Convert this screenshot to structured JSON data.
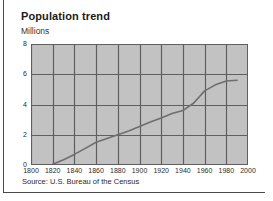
{
  "chart_data": {
    "type": "line",
    "title": "Population trend",
    "subtitle": "Millions",
    "ylabel": "Millions",
    "xlabel": "",
    "source": "Source: U.S. Bureau of the Census",
    "xlim": [
      1800,
      2000
    ],
    "ylim": [
      0,
      8
    ],
    "grid": true,
    "legend": "none",
    "xticks": [
      1800,
      1820,
      1840,
      1860,
      1880,
      1900,
      1920,
      1940,
      1960,
      1980,
      2000
    ],
    "yticks": [
      0,
      2,
      4,
      6,
      8
    ],
    "xtick_labels": [
      "1800",
      "1820",
      "1840",
      "1860",
      "1880",
      "1900",
      "1920",
      "1940",
      "1960",
      "1980",
      "2000"
    ],
    "ytick_labels": [
      "0",
      "2",
      "4",
      "6",
      "8"
    ],
    "series": [
      {
        "name": "Population",
        "x": [
          1820,
          1830,
          1840,
          1850,
          1860,
          1870,
          1880,
          1890,
          1900,
          1910,
          1920,
          1930,
          1940,
          1950,
          1960,
          1970,
          1980,
          1990
        ],
        "values": [
          0.05,
          0.35,
          0.7,
          1.1,
          1.5,
          1.75,
          2.0,
          2.25,
          2.55,
          2.85,
          3.1,
          3.4,
          3.6,
          4.1,
          4.9,
          5.3,
          5.55,
          5.6
        ]
      }
    ]
  },
  "colors": {
    "plot_background": "#c2c2c2",
    "gridline": "#5f5f5f",
    "series_line": "#6e6e6e",
    "frame": "#4a4a4a",
    "text": "#2b2b2b"
  }
}
